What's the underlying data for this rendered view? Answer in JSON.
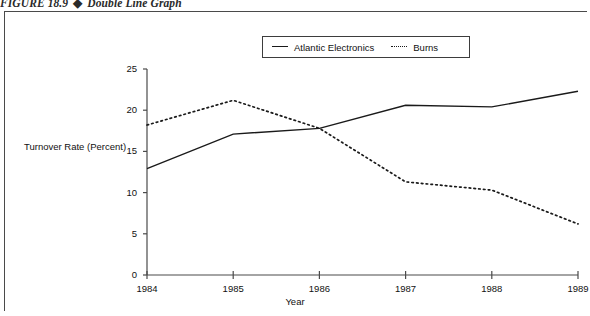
{
  "figure": {
    "number": "FIGURE 18.9",
    "separator": "◆",
    "caption": "Double Line Graph"
  },
  "legend": {
    "position": "top-center",
    "entries": [
      {
        "label": "Atlantic Electronics",
        "style": "solid",
        "color": "#1a1a1a"
      },
      {
        "label": "Burns",
        "style": "dotted",
        "color": "#1a1a1a"
      }
    ]
  },
  "axes": {
    "y_label": "Turnover Rate (Percent)",
    "x_label": "Year",
    "y_ticks": [
      "0",
      "5",
      "10",
      "15",
      "20",
      "25"
    ],
    "x_ticks": [
      "1984",
      "1985",
      "1986",
      "1987",
      "1988",
      "1989"
    ]
  },
  "chart_data": {
    "type": "line",
    "title": "Double Line Graph",
    "xlabel": "Year",
    "ylabel": "Turnover Rate (Percent)",
    "x": [
      "1984",
      "1985",
      "1986",
      "1987",
      "1988",
      "1989"
    ],
    "categories": [
      "1984",
      "1985",
      "1986",
      "1987",
      "1988",
      "1989"
    ],
    "series": [
      {
        "name": "Atlantic Electronics",
        "style": "solid",
        "color": "#1a1a1a",
        "values": [
          12.9,
          17.1,
          17.8,
          20.6,
          20.4,
          22.3
        ]
      },
      {
        "name": "Burns",
        "style": "dotted",
        "color": "#1a1a1a",
        "values": [
          18.2,
          21.2,
          17.8,
          11.3,
          10.3,
          6.2
        ]
      }
    ],
    "ylim": [
      0,
      25
    ],
    "ytick_step": 5,
    "grid": false,
    "legend_position": "top-center"
  }
}
